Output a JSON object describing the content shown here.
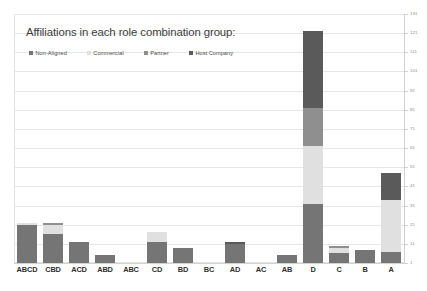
{
  "chart_data": {
    "type": "bar",
    "subtype": "stacked-bar",
    "title": "Affiliations in each role combination group:",
    "xlabel": "",
    "ylabel": "",
    "categories": [
      "ABCD",
      "CBD",
      "ACD",
      "ABD",
      "ABC",
      "CD",
      "BD",
      "BC",
      "AD",
      "AC",
      "AB",
      "D",
      "C",
      "B",
      "A"
    ],
    "series": [
      {
        "name": "Non-Aligned",
        "color": "#757575",
        "values": [
          20,
          15,
          11,
          4,
          0,
          11,
          8,
          0,
          10,
          0,
          4,
          31,
          5,
          7,
          6
        ]
      },
      {
        "name": "Commercial",
        "color": "#e0e0e0",
        "values": [
          1,
          5,
          0,
          0,
          0,
          5,
          0,
          0,
          0,
          0,
          0,
          30,
          3,
          0,
          27
        ]
      },
      {
        "name": "Partner",
        "color": "#8f8f8f",
        "values": [
          0,
          1,
          0,
          0,
          0,
          0,
          0,
          0,
          0,
          0,
          0,
          20,
          1,
          0,
          0
        ]
      },
      {
        "name": "Host Company",
        "color": "#5a5a5a",
        "values": [
          0,
          0,
          0,
          0,
          0,
          0,
          0,
          0,
          1,
          0,
          0,
          40,
          0,
          0,
          14
        ]
      }
    ],
    "totals": [
      21,
      21,
      11,
      4,
      0,
      16,
      8,
      0,
      11,
      0,
      4,
      121,
      9,
      7,
      47
    ],
    "ylim": [
      1,
      131
    ],
    "y_ticks": [
      1,
      11,
      21,
      31,
      41,
      51,
      61,
      71,
      81,
      91,
      101,
      111,
      121,
      131
    ],
    "y_tick_labels": [
      "1",
      "11",
      "21",
      "31",
      "41",
      "51",
      "61",
      "71",
      "81",
      "91",
      "101",
      "111",
      "121",
      "131"
    ],
    "grid": true,
    "grid_axis": "y",
    "legend_position": "top-left",
    "axis_position": "right",
    "background_color": "#ffffff",
    "grid_color": "#e6e6e6",
    "text_color": "#3d3d3d"
  },
  "legend": {
    "items": [
      {
        "label": "Non-Aligned",
        "color": "#757575"
      },
      {
        "label": "Commercial",
        "color": "#e0e0e0"
      },
      {
        "label": "Partner",
        "color": "#8f8f8f"
      },
      {
        "label": "Host Company",
        "color": "#5a5a5a"
      }
    ]
  }
}
